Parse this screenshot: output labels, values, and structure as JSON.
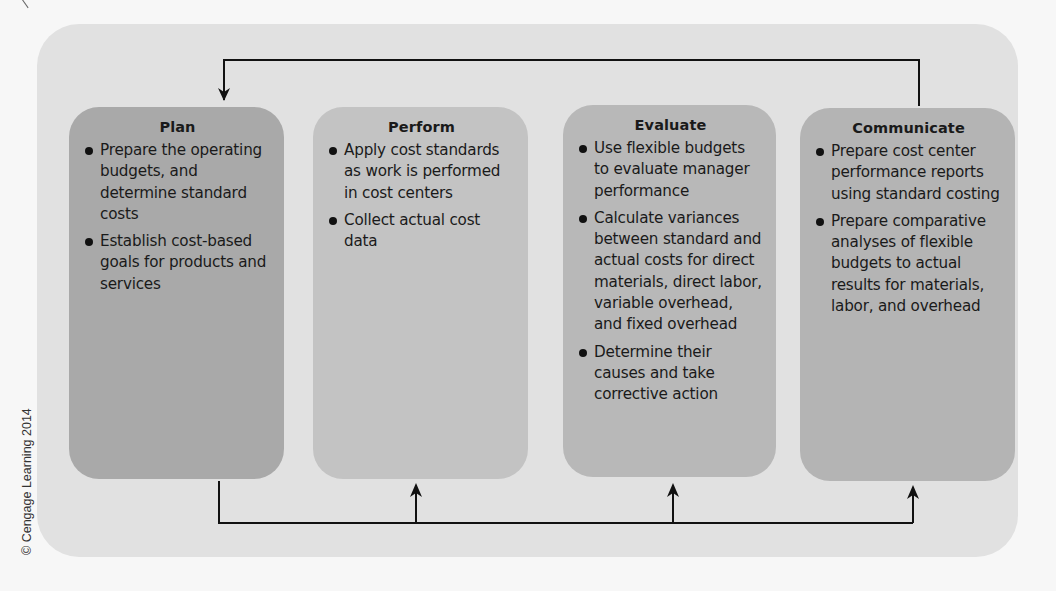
{
  "diagram": {
    "type": "management-process-cycle",
    "stages": [
      {
        "title": "Plan",
        "color": "#a9a9a9",
        "bullets": [
          "Prepare the operating budgets, and determine standard costs",
          "Establish cost-based goals for products and services"
        ]
      },
      {
        "title": "Perform",
        "color": "#c3c3c3",
        "bullets": [
          "Apply cost standards as work is performed in cost centers",
          "Collect actual cost data"
        ]
      },
      {
        "title": "Evaluate",
        "color": "#b8b8b8",
        "bullets": [
          "Use flexible budgets to evaluate manager performance",
          "Calculate variances between standard and actual costs for direct materials, direct labor, variable overhead, and fixed overhead",
          "Determine their causes and take corrective action"
        ]
      },
      {
        "title": "Communicate",
        "color": "#b4b4b4",
        "bullets": [
          "Prepare cost center performance reports using standard costing",
          "Prepare comparative analyses of flexible budgets to actual results for materials, labor, and overhead"
        ]
      }
    ],
    "connectors": [
      {
        "from": "Communicate",
        "to": "Plan",
        "route": "top feedback loop"
      },
      {
        "from": "Plan",
        "to": "Perform",
        "route": "bottom line"
      },
      {
        "from": "Plan",
        "to": "Evaluate",
        "route": "bottom line"
      },
      {
        "from": "Plan",
        "to": "Communicate",
        "route": "bottom line"
      }
    ],
    "panel_color": "#e1e1e1",
    "line_color": "#111111"
  },
  "copyright": "© Cengage Learning 2014"
}
